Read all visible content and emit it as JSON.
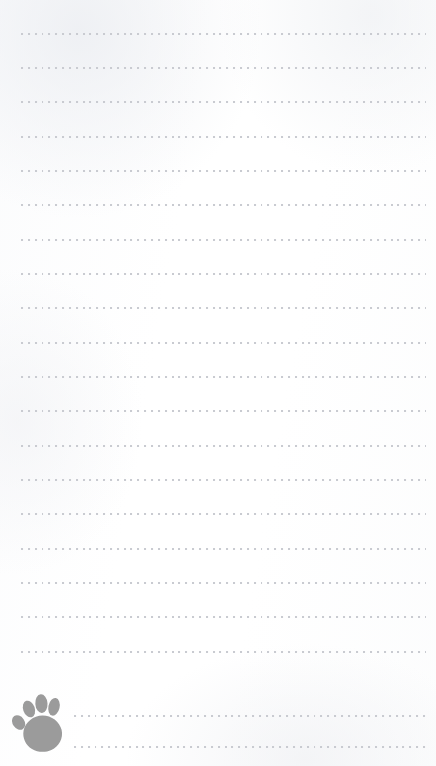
{
  "page": {
    "width": 436,
    "height": 766,
    "background_color": "#ffffff",
    "paper_tint_color": "#f2f3f6"
  },
  "ruling": {
    "style": "dotted",
    "dot_color": "#c9cbd1",
    "dot_size_px": 2,
    "dot_spacing_px": 6.85,
    "line_count": 21,
    "first_line_y_px": 33,
    "line_spacing_px": 34.3,
    "default_left_px": 21,
    "default_right_px": 426,
    "indented_left_px": 74,
    "indented_line_indexes": [
      19,
      20
    ],
    "lines": [
      {
        "index": 0,
        "y": 33,
        "left": 21,
        "right": 426,
        "indented": false
      },
      {
        "index": 1,
        "y": 67,
        "left": 21,
        "right": 426,
        "indented": false
      },
      {
        "index": 2,
        "y": 101,
        "left": 21,
        "right": 426,
        "indented": false
      },
      {
        "index": 3,
        "y": 136,
        "left": 21,
        "right": 426,
        "indented": false
      },
      {
        "index": 4,
        "y": 170,
        "left": 21,
        "right": 426,
        "indented": false
      },
      {
        "index": 5,
        "y": 204,
        "left": 21,
        "right": 426,
        "indented": false
      },
      {
        "index": 6,
        "y": 239,
        "left": 21,
        "right": 426,
        "indented": false
      },
      {
        "index": 7,
        "y": 273,
        "left": 21,
        "right": 426,
        "indented": false
      },
      {
        "index": 8,
        "y": 307,
        "left": 21,
        "right": 426,
        "indented": false
      },
      {
        "index": 9,
        "y": 342,
        "left": 21,
        "right": 426,
        "indented": false
      },
      {
        "index": 10,
        "y": 376,
        "left": 21,
        "right": 426,
        "indented": false
      },
      {
        "index": 11,
        "y": 410,
        "left": 21,
        "right": 426,
        "indented": false
      },
      {
        "index": 12,
        "y": 445,
        "left": 21,
        "right": 426,
        "indented": false
      },
      {
        "index": 13,
        "y": 479,
        "left": 21,
        "right": 426,
        "indented": false
      },
      {
        "index": 14,
        "y": 513,
        "left": 21,
        "right": 426,
        "indented": false
      },
      {
        "index": 15,
        "y": 548,
        "left": 21,
        "right": 426,
        "indented": false
      },
      {
        "index": 16,
        "y": 582,
        "left": 21,
        "right": 426,
        "indented": false
      },
      {
        "index": 17,
        "y": 616,
        "left": 21,
        "right": 426,
        "indented": false
      },
      {
        "index": 18,
        "y": 651,
        "left": 21,
        "right": 426,
        "indented": false
      },
      {
        "index": 19,
        "y": 715,
        "left": 74,
        "right": 426,
        "indented": true
      },
      {
        "index": 20,
        "y": 746,
        "left": 74,
        "right": 426,
        "indented": true
      }
    ]
  },
  "decoration": {
    "paw": {
      "icon_name": "paw-print-icon",
      "color": "#9b9b9b",
      "toe_count": 4,
      "left_px": 12,
      "top_px": 692,
      "width_px": 54,
      "height_px": 62
    }
  }
}
